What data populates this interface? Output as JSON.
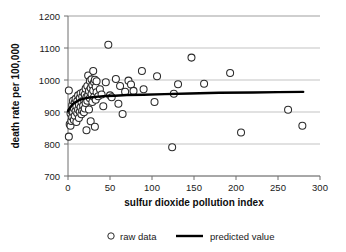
{
  "chart_data": {
    "type": "scatter",
    "title": "",
    "xlabel": "sulfur dioxide pollution index",
    "ylabel": "death rate per 100,000",
    "xlim": [
      0,
      300
    ],
    "ylim": [
      700,
      1200
    ],
    "xticks": [
      "0",
      "50",
      "100",
      "150",
      "200",
      "250",
      "300"
    ],
    "yticks": [
      "700",
      "800",
      "900",
      "1000",
      "1100",
      "1200"
    ],
    "grid": "horizontal",
    "legend_position": "bottom-center",
    "marker_style": "open-circle",
    "series": [
      {
        "name": "raw data",
        "type": "scatter",
        "points": [
          [
            1,
            967
          ],
          [
            1,
            823
          ],
          [
            2,
            862
          ],
          [
            3,
            857
          ],
          [
            3,
            895
          ],
          [
            4,
            904
          ],
          [
            4,
            872
          ],
          [
            5,
            884
          ],
          [
            5,
            921
          ],
          [
            6,
            899
          ],
          [
            6,
            935
          ],
          [
            7,
            875
          ],
          [
            7,
            912
          ],
          [
            8,
            929
          ],
          [
            8,
            888
          ],
          [
            9,
            903
          ],
          [
            9,
            941
          ],
          [
            10,
            918
          ],
          [
            10,
            869
          ],
          [
            11,
            934
          ],
          [
            11,
            896
          ],
          [
            12,
            952
          ],
          [
            12,
            908
          ],
          [
            13,
            923
          ],
          [
            13,
            881
          ],
          [
            14,
            944
          ],
          [
            14,
            901
          ],
          [
            15,
            958
          ],
          [
            15,
            915
          ],
          [
            16,
            931
          ],
          [
            16,
            893
          ],
          [
            17,
            948
          ],
          [
            17,
            905
          ],
          [
            18,
            962
          ],
          [
            18,
            920
          ],
          [
            19,
            938
          ],
          [
            19,
            899
          ],
          [
            20,
            955
          ],
          [
            20,
            911
          ],
          [
            21,
            973
          ],
          [
            21,
            928
          ],
          [
            22,
            947
          ],
          [
            22,
            843
          ],
          [
            23,
            981
          ],
          [
            23,
            935
          ],
          [
            24,
            1014
          ],
          [
            24,
            952
          ],
          [
            25,
            966
          ],
          [
            25,
            908
          ],
          [
            26,
            997
          ],
          [
            26,
            943
          ],
          [
            27,
            975
          ],
          [
            27,
            871
          ],
          [
            28,
            1002
          ],
          [
            28,
            956
          ],
          [
            29,
            984
          ],
          [
            29,
            931
          ],
          [
            30,
            1028
          ],
          [
            30,
            967
          ],
          [
            31,
            993
          ],
          [
            31,
            947
          ],
          [
            32,
            1001
          ],
          [
            32,
            854
          ],
          [
            33,
            978
          ],
          [
            33,
            938
          ],
          [
            34,
            996
          ],
          [
            34,
            962
          ],
          [
            36,
            949
          ],
          [
            38,
            971
          ],
          [
            40,
            955
          ],
          [
            42,
            918
          ],
          [
            45,
            993
          ],
          [
            48,
            1110
          ],
          [
            50,
            952
          ],
          [
            52,
            946
          ],
          [
            57,
            1003
          ],
          [
            60,
            926
          ],
          [
            62,
            981
          ],
          [
            65,
            894
          ],
          [
            68,
            963
          ],
          [
            72,
            998
          ],
          [
            75,
            986
          ],
          [
            78,
            966
          ],
          [
            88,
            1028
          ],
          [
            90,
            971
          ],
          [
            103,
            931
          ],
          [
            106,
            1012
          ],
          [
            124,
            790
          ],
          [
            126,
            957
          ],
          [
            131,
            987
          ],
          [
            147,
            1070
          ],
          [
            162,
            988
          ],
          [
            193,
            1022
          ],
          [
            206,
            836
          ],
          [
            262,
            907
          ],
          [
            279,
            857
          ]
        ]
      },
      {
        "name": "predicted value",
        "type": "line",
        "points": [
          [
            0,
            903
          ],
          [
            2,
            912
          ],
          [
            4,
            919
          ],
          [
            6,
            925
          ],
          [
            8,
            929
          ],
          [
            11,
            934
          ],
          [
            14,
            938
          ],
          [
            18,
            941
          ],
          [
            23,
            944
          ],
          [
            29,
            946
          ],
          [
            36,
            948
          ],
          [
            45,
            950
          ],
          [
            56,
            951
          ],
          [
            70,
            953
          ],
          [
            90,
            954
          ],
          [
            115,
            956
          ],
          [
            145,
            958
          ],
          [
            180,
            960
          ],
          [
            220,
            961
          ],
          [
            250,
            962
          ],
          [
            280,
            963
          ]
        ]
      }
    ]
  },
  "legend": {
    "raw_data_label": "raw data",
    "predicted_label": "predicted value"
  },
  "colors": {
    "marker_stroke": "#2b2b2b",
    "marker_fill": "#ffffff",
    "trend_line": "#000000",
    "gridline": "#b4b4b4",
    "axis": "#6e6e6e",
    "text": "#1a1a1a",
    "background": "#ffffff"
  }
}
